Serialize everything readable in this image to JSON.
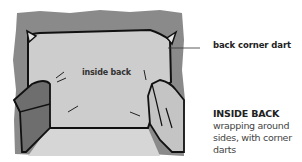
{
  "illustration": {
    "subject": "chair inside back",
    "inner_label": "inside back",
    "colors": {
      "frame_background": "#8a8a8a",
      "fabric": "#cfcfcf",
      "seat": "#d8d8d8",
      "left_arm": "#6e6e6e",
      "right_arm": "#c4c4c4",
      "outline": "#111111"
    }
  },
  "callout": {
    "label": "back corner dart"
  },
  "caption": {
    "title": "INSIDE BACK",
    "body": "wrapping around sides, with corner darts"
  }
}
